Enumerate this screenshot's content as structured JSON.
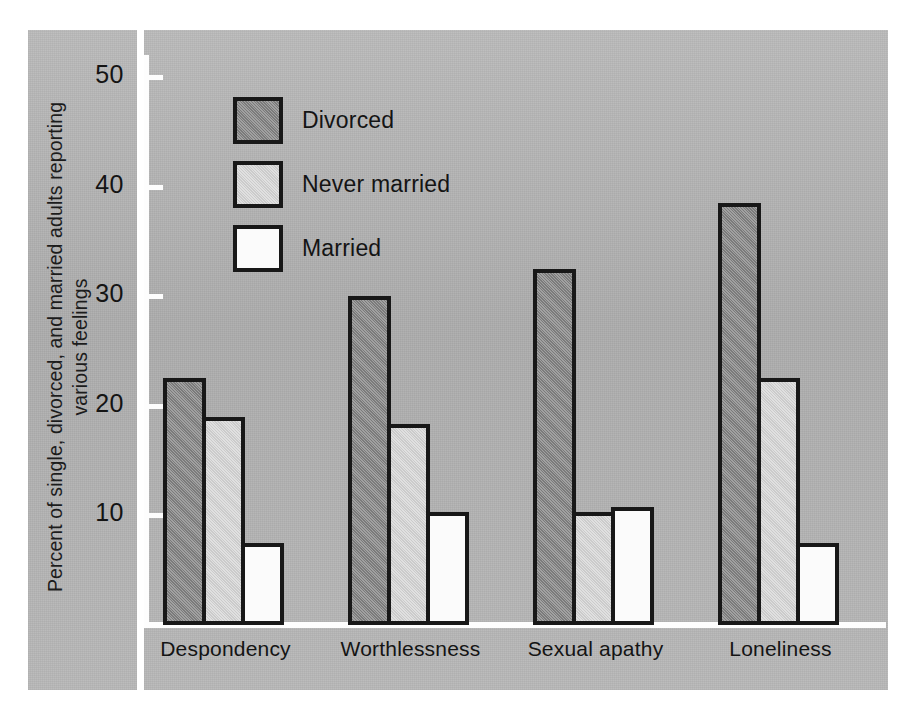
{
  "chart_data": {
    "type": "bar",
    "title": "",
    "xlabel": "",
    "ylabel": "Percent of single, divorced, and married adults reporting various feelings",
    "ylim": [
      0,
      52
    ],
    "yticks": [
      10,
      20,
      30,
      40,
      50
    ],
    "ytick_labels": [
      "10",
      "20",
      "30",
      "40",
      "50"
    ],
    "grid": false,
    "legend_position": "upper-left-inside",
    "categories": [
      "Despondency",
      "Worthlessness",
      "Sexual apathy",
      "Loneliness"
    ],
    "series": [
      {
        "name": "Divorced",
        "color": "#8c8c8c",
        "values": [
          22.5,
          30.0,
          32.5,
          38.5
        ]
      },
      {
        "name": "Never married",
        "color": "#d6d6d6",
        "values": [
          19.0,
          18.3,
          10.3,
          22.5
        ]
      },
      {
        "name": "Married",
        "color": "#fbfbfb",
        "values": [
          7.5,
          10.3,
          10.8,
          7.5
        ]
      }
    ]
  },
  "figure": {
    "background_color": "#b4b4b4",
    "axis_color": "#fdfdfd",
    "outline_color": "#181818",
    "text_color": "#141414"
  }
}
